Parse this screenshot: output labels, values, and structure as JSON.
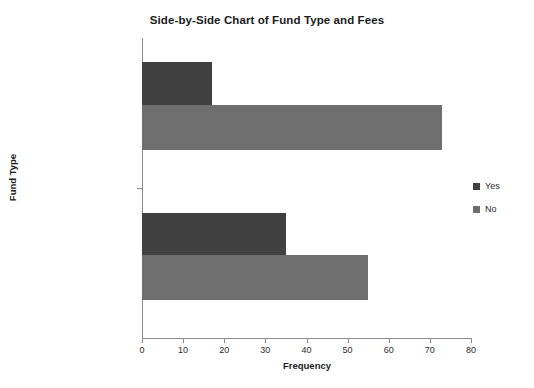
{
  "chart_data": {
    "type": "bar",
    "orientation": "horizontal",
    "title": "Side-by-Side Chart of Fund Type and Fees",
    "xlabel": "Frequency",
    "ylabel": "Fund Type",
    "categories": [
      "Short-term Corporate",
      "Intermediate government"
    ],
    "series": [
      {
        "name": "Yes",
        "values": [
          17,
          35
        ],
        "color": "#404040"
      },
      {
        "name": "No",
        "values": [
          73,
          55
        ],
        "color": "#6e6e6e"
      }
    ],
    "xlim": [
      0,
      80
    ],
    "xticks": [
      0,
      10,
      20,
      30,
      40,
      50,
      60,
      70,
      80
    ],
    "xtick_labels": [
      "0",
      "10",
      "20",
      "30",
      "40",
      "50",
      "60",
      "70",
      "80"
    ],
    "grid": false,
    "legend_position": "right",
    "background_color": "#ffffff",
    "axis_color": "#8a8a8a"
  },
  "legend": {
    "entries": [
      {
        "label": "Yes",
        "color": "#404040"
      },
      {
        "label": "No",
        "color": "#6e6e6e"
      }
    ]
  },
  "bars": [
    {
      "category": "Short-term Corporate",
      "series": "Yes",
      "value": 17,
      "color": "#404040",
      "top": 24,
      "height": 43
    },
    {
      "category": "Short-term Corporate",
      "series": "No",
      "value": 73,
      "color": "#6e6e6e",
      "top": 67,
      "height": 45
    },
    {
      "category": "Intermediate government",
      "series": "Yes",
      "value": 35,
      "color": "#404040",
      "top": 175,
      "height": 42
    },
    {
      "category": "Intermediate government",
      "series": "No",
      "value": 55,
      "color": "#6e6e6e",
      "top": 217,
      "height": 45
    }
  ],
  "category_label_positions": [
    104,
    254
  ],
  "y_tick_positions": [
    188
  ]
}
